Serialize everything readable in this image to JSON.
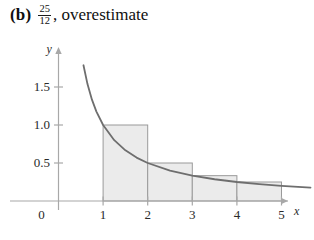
{
  "caption": {
    "part_label": "(b)",
    "fraction_numerator": "25",
    "fraction_denominator": "12",
    "tail_text": ", overestimate"
  },
  "chart_data": {
    "type": "bar",
    "title": "",
    "subtitle": "",
    "xlabel": "x",
    "ylabel": "y",
    "xlim": [
      0,
      5.6
    ],
    "ylim": [
      0,
      1.78
    ],
    "grid": false,
    "legend": null,
    "annotations": [],
    "x_ticks": [
      {
        "value": 1,
        "label": "1"
      },
      {
        "value": 2,
        "label": "2"
      },
      {
        "value": 3,
        "label": "3"
      },
      {
        "value": 4,
        "label": "4"
      },
      {
        "value": 5,
        "label": "5"
      }
    ],
    "y_ticks": [
      {
        "value": 0.5,
        "label": "0.5"
      },
      {
        "value": 1.0,
        "label": "1.0"
      },
      {
        "value": 1.5,
        "label": "1.5"
      }
    ],
    "origin_label": "0",
    "categories": [
      "1-2",
      "2-3",
      "3-4",
      "4-5"
    ],
    "values": [
      1.0,
      0.5,
      0.3333,
      0.25
    ],
    "bars": [
      {
        "x_start": 1,
        "x_end": 2,
        "height": 1.0
      },
      {
        "x_start": 2,
        "x_end": 3,
        "height": 0.5
      },
      {
        "x_start": 3,
        "x_end": 4,
        "height": 0.3333
      },
      {
        "x_start": 4,
        "x_end": 5,
        "height": 0.25
      }
    ],
    "curve": {
      "name": "f(x) = 1/x",
      "x_start": 0.56,
      "x_end": 5.65,
      "points": [
        {
          "x": 0.56,
          "y": 1.786
        },
        {
          "x": 0.65,
          "y": 1.538
        },
        {
          "x": 0.75,
          "y": 1.333
        },
        {
          "x": 0.85,
          "y": 1.176
        },
        {
          "x": 1.0,
          "y": 1.0
        },
        {
          "x": 1.25,
          "y": 0.8
        },
        {
          "x": 1.5,
          "y": 0.667
        },
        {
          "x": 1.75,
          "y": 0.571
        },
        {
          "x": 2.0,
          "y": 0.5
        },
        {
          "x": 2.5,
          "y": 0.4
        },
        {
          "x": 3.0,
          "y": 0.333
        },
        {
          "x": 3.5,
          "y": 0.286
        },
        {
          "x": 4.0,
          "y": 0.25
        },
        {
          "x": 4.5,
          "y": 0.222
        },
        {
          "x": 5.0,
          "y": 0.2
        },
        {
          "x": 5.65,
          "y": 0.177
        }
      ]
    }
  },
  "colors": {
    "bar_fill": "#ebebeb",
    "bar_stroke": "#9a9a9a",
    "curve": "#6e6e6e",
    "axis": "#a8a8a8",
    "text": "#1a1a1a"
  }
}
